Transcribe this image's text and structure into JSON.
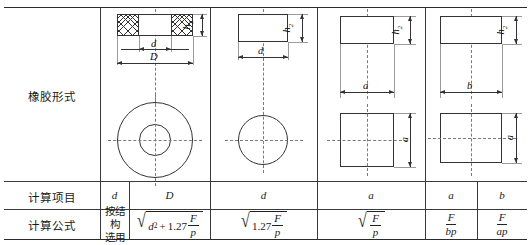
{
  "table": {
    "rows": [
      {
        "id": "rubber-form",
        "label": "橡胶形式"
      },
      {
        "id": "calc-item",
        "label": "计算项目"
      },
      {
        "id": "calc-formula",
        "label": "计算公式"
      }
    ],
    "columns": [
      {
        "id": "annulus",
        "shape": "annular-ring"
      },
      {
        "id": "cylinder",
        "shape": "solid-cylinder"
      },
      {
        "id": "square",
        "shape": "square-prism"
      },
      {
        "id": "rectangle",
        "shape": "rectangular-prism"
      }
    ],
    "calc_items": [
      {
        "col": "annulus",
        "sym1": "d",
        "sym2": "D"
      },
      {
        "col": "cylinder",
        "sym1": "d"
      },
      {
        "col": "square",
        "sym1": "a"
      },
      {
        "col": "rectangle",
        "sym1": "a",
        "sym2": "b"
      }
    ],
    "formulas": {
      "annulus_d_text_line1": "按结构",
      "annulus_d_text_line2": "选用",
      "annulus_D": {
        "radicand_a": "d",
        "radicand_exp": "2",
        "plus": "+",
        "coef": "1.27",
        "num": "F",
        "den": "p"
      },
      "cylinder_d": {
        "coef": "1.27",
        "num": "F",
        "den": "p"
      },
      "square_a": {
        "num": "F",
        "den": "p"
      },
      "rect_a": {
        "num": "F",
        "den": "bp"
      },
      "rect_b": {
        "num": "F",
        "den": "ap"
      }
    }
  },
  "diagrams": {
    "annulus": {
      "h_label": "h",
      "h_sub": "2",
      "inner_dim": "d",
      "outer_dim": "D"
    },
    "cylinder": {
      "h_label": "h",
      "h_sub": "2",
      "dia_dim": "d"
    },
    "square": {
      "h_label": "h",
      "h_sub": "2",
      "top_dim": "a",
      "side_dim": "a"
    },
    "rectangle": {
      "h_label": "h",
      "h_sub": "2",
      "top_dim": "b",
      "side_dim": "a"
    }
  },
  "colors": {
    "ink": "#2a2a2a",
    "rule": "#3a3a3a",
    "centerline": "#7a7a7a"
  }
}
